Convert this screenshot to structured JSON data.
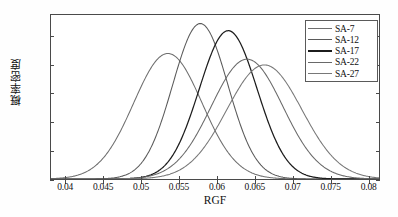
{
  "chart_data": {
    "type": "line",
    "title": "",
    "xlabel": "RGF",
    "ylabel": "概率密度",
    "xlim": [
      0.038,
      0.0815
    ],
    "ylim": [
      0,
      115
    ],
    "xticks": [
      0.04,
      0.045,
      0.05,
      0.055,
      0.06,
      0.065,
      0.07,
      0.075,
      0.08
    ],
    "xticklabels": [
      "0.04",
      "0.045",
      "0.05",
      "0.055",
      "0.06",
      "0.065",
      "0.07",
      "0.075",
      "0.08"
    ],
    "yticks": [
      0,
      20,
      40,
      60,
      80,
      100
    ],
    "yticklabels": [
      "0",
      "20",
      "40",
      "60",
      "80",
      "100"
    ],
    "grid": false,
    "legend_position": "top-right",
    "series": [
      {
        "name": "SA-7",
        "mean": 0.0535,
        "peak": 88,
        "sigma": 0.00453,
        "color": "#6e6e6e"
      },
      {
        "name": "SA-12",
        "mean": 0.0578,
        "peak": 109,
        "sigma": 0.00366,
        "color": "#5a5a5a"
      },
      {
        "name": "SA-17",
        "mean": 0.0615,
        "peak": 104,
        "sigma": 0.00384,
        "color": "#1c1c1c"
      },
      {
        "name": "SA-22",
        "mean": 0.064,
        "peak": 84,
        "sigma": 0.00475,
        "color": "#696969"
      },
      {
        "name": "SA-27",
        "mean": 0.0663,
        "peak": 80,
        "sigma": 0.00499,
        "color": "#787878"
      }
    ]
  },
  "legend": {
    "items": [
      {
        "label": "SA-7"
      },
      {
        "label": "SA-12"
      },
      {
        "label": "SA-17"
      },
      {
        "label": "SA-22"
      },
      {
        "label": "SA-27"
      }
    ]
  },
  "caption": {
    "text": ""
  }
}
